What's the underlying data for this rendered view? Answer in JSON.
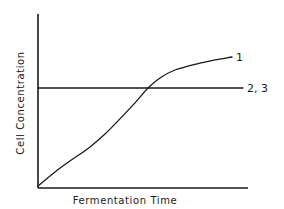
{
  "chart_data": {
    "type": "line",
    "title": "",
    "xlabel": "Fermentation Time",
    "ylabel": "Cell Concentration",
    "xlim": [
      0,
      100
    ],
    "ylim": [
      0,
      100
    ],
    "grid": false,
    "ticks": false,
    "legend": "inline labels at right end of each line",
    "series": [
      {
        "name": "1",
        "shape": "sigmoid-like increasing curve",
        "x": [
          0,
          8.1,
          15.2,
          24.8,
          31.9,
          39.0,
          46.2,
          52.4,
          58.1,
          65.2,
          77.1,
          84.3,
          92.4
        ],
        "y": [
          1.1,
          9.2,
          15.5,
          23.6,
          31.0,
          39.7,
          48.9,
          57.5,
          63.2,
          67.8,
          71.8,
          73.6,
          75.3
        ]
      },
      {
        "name": "2, 3",
        "shape": "horizontal constant line",
        "x": [
          0,
          97.6
        ],
        "y": [
          57.5,
          57.5
        ]
      }
    ]
  },
  "labels": {
    "x_axis": "Fermentation Time",
    "y_axis": "Cell Concentration",
    "series_1": "1",
    "series_2_3": "2, 3"
  },
  "colors": {
    "line": "#1a1a1a",
    "background": "#ffffff"
  }
}
